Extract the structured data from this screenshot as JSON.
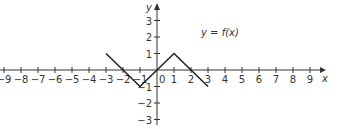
{
  "chart_data": {
    "type": "line",
    "title": "",
    "function_label": "y = f(x)",
    "xlabel": "x",
    "ylabel": "y",
    "xlim": [
      -9,
      9
    ],
    "ylim": [
      -3,
      3
    ],
    "x_ticks": [
      -9,
      -8,
      -7,
      -6,
      -5,
      -4,
      -3,
      -2,
      -1,
      0,
      1,
      2,
      3,
      4,
      5,
      6,
      7,
      8,
      9
    ],
    "y_ticks": [
      -3,
      -2,
      -1,
      1,
      2,
      3
    ],
    "grid": false,
    "series": [
      {
        "name": "f(x)",
        "x": [
          -3,
          -1,
          1,
          3
        ],
        "y": [
          1,
          -1,
          1,
          -1
        ]
      }
    ]
  },
  "labels": {
    "x_axis": "x",
    "y_axis": "y",
    "function": "y = f(x)",
    "origin": "0",
    "x_ticks": [
      "−9",
      "−8",
      "−7",
      "−6",
      "−5",
      "−4",
      "−3",
      "−2",
      "−1",
      "1",
      "2",
      "3",
      "4",
      "5",
      "6",
      "7",
      "8",
      "9"
    ],
    "y_ticks": [
      "3",
      "2",
      "1",
      "−1",
      "−2",
      "−3"
    ]
  }
}
